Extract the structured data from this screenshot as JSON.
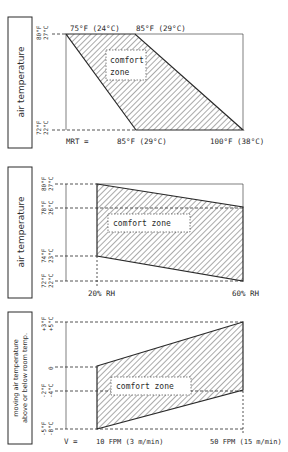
{
  "panels": [
    {
      "id": "mrt",
      "side_label": "air temperature",
      "y_ticks": [
        {
          "f": "80°F",
          "c": "27°C"
        },
        {
          "f": "72°F",
          "c": "22°C"
        }
      ],
      "top_labels": [
        "75°F (24°C)",
        "85°F (29°C)"
      ],
      "bottom_prefix": "MRT =",
      "bottom_labels": [
        "85°F (29°C)",
        "100°F (38°C)"
      ],
      "zone_label_line1": "comfort",
      "zone_label_line2": "zone"
    },
    {
      "id": "rh",
      "side_label": "air temperature",
      "y_ticks": [
        {
          "f": "80°F",
          "c": "27°C"
        },
        {
          "f": "78°F",
          "c": "26°C"
        },
        {
          "f": "74°F",
          "c": "23°C"
        },
        {
          "f": "72°F",
          "c": "22°C"
        }
      ],
      "bottom_labels": [
        "20% RH",
        "60% RH"
      ],
      "zone_label": "comfort zone"
    },
    {
      "id": "velocity",
      "side_label_line1": "moving air temperature",
      "side_label_line2": "above or below room temp.",
      "y_ticks": [
        {
          "f": "+3°F",
          "c": "+5°C"
        },
        {
          "f": "0",
          "c": ""
        },
        {
          "f": "-2°F",
          "c": "-4°C"
        },
        {
          "f": "-5°F",
          "c": "-8°C"
        }
      ],
      "bottom_prefix": "V =",
      "bottom_labels": [
        "10 FPM (3 m/min)",
        "50 FPM (15 m/min)"
      ],
      "zone_label": "comfort zone"
    }
  ],
  "colors": {
    "ink": "#2a2a2a",
    "hatch": "#555555",
    "paper": "#ffffff"
  }
}
